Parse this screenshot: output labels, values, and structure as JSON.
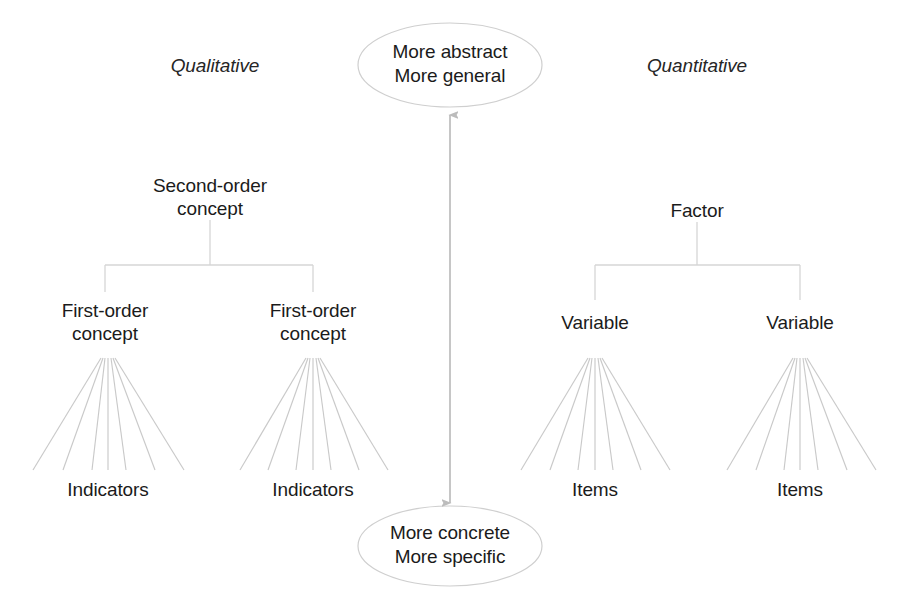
{
  "diagram": {
    "columns": {
      "left_heading": "Qualitative",
      "right_heading": "Quantitative"
    },
    "poles": {
      "top": "More abstract\nMore general",
      "top_line1": "More abstract",
      "top_line2": "More general",
      "bottom": "More concrete\nMore specific",
      "bottom_line1": "More concrete",
      "bottom_line2": "More specific"
    },
    "qualitative_tree": {
      "root": "Second-order\nconcept",
      "children": [
        {
          "label": "First-order\nconcept",
          "leaf": "Indicators",
          "fan_lines": 7
        },
        {
          "label": "First-order\nconcept",
          "leaf": "Indicators",
          "fan_lines": 7
        }
      ]
    },
    "quantitative_tree": {
      "root": "Factor",
      "children": [
        {
          "label": "Variable",
          "leaf": "Items",
          "fan_lines": 7
        },
        {
          "label": "Variable",
          "leaf": "Items",
          "fan_lines": 7
        }
      ]
    },
    "axis_arrow": {
      "name": "abstraction-axis",
      "direction": "double-headed vertical"
    },
    "colors": {
      "background": "#ffffff",
      "text": "#1b1b1b",
      "connector_line": "#d6d6d6",
      "fan_line": "#c9c9c9",
      "ellipse_stroke": "#cfcfcf",
      "arrow": "#bcbcbc"
    }
  }
}
